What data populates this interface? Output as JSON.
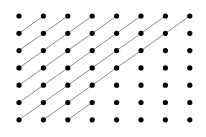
{
  "figure": {
    "name": "dot-lattice-with-diagonal-paths",
    "width": 206,
    "height": 137,
    "background_color": "#ffffff"
  },
  "lattice": {
    "columns": 8,
    "rows": 7,
    "origin_x": 19,
    "origin_y": 16,
    "step_x": 24.4,
    "step_y": 17.3,
    "dot_radius": 2.6,
    "dot_color": "#000000",
    "total_dots": 56
  },
  "edges": {
    "color": "#8c8c8c",
    "width": 1,
    "direction": "lower-left to upper-right",
    "description": "Unit diagonal segments connecting each dot to its up-right neighbor",
    "count": 28,
    "list": [
      {
        "from_col": 0,
        "from_row": 1,
        "to_col": 1,
        "to_row": 0
      },
      {
        "from_col": 0,
        "from_row": 2,
        "to_col": 1,
        "to_row": 1
      },
      {
        "from_col": 1,
        "from_row": 1,
        "to_col": 2,
        "to_row": 0
      },
      {
        "from_col": 0,
        "from_row": 3,
        "to_col": 1,
        "to_row": 2
      },
      {
        "from_col": 1,
        "from_row": 2,
        "to_col": 2,
        "to_row": 1
      },
      {
        "from_col": 2,
        "from_row": 1,
        "to_col": 3,
        "to_row": 0
      },
      {
        "from_col": 0,
        "from_row": 4,
        "to_col": 1,
        "to_row": 3
      },
      {
        "from_col": 1,
        "from_row": 3,
        "to_col": 2,
        "to_row": 2
      },
      {
        "from_col": 2,
        "from_row": 2,
        "to_col": 3,
        "to_row": 1
      },
      {
        "from_col": 3,
        "from_row": 1,
        "to_col": 4,
        "to_row": 0
      },
      {
        "from_col": 0,
        "from_row": 5,
        "to_col": 1,
        "to_row": 4
      },
      {
        "from_col": 1,
        "from_row": 4,
        "to_col": 2,
        "to_row": 3
      },
      {
        "from_col": 2,
        "from_row": 3,
        "to_col": 3,
        "to_row": 2
      },
      {
        "from_col": 3,
        "from_row": 2,
        "to_col": 4,
        "to_row": 1
      },
      {
        "from_col": 4,
        "from_row": 1,
        "to_col": 5,
        "to_row": 0
      },
      {
        "from_col": 0,
        "from_row": 6,
        "to_col": 1,
        "to_row": 5
      },
      {
        "from_col": 1,
        "from_row": 5,
        "to_col": 2,
        "to_row": 4
      },
      {
        "from_col": 2,
        "from_row": 4,
        "to_col": 3,
        "to_row": 3
      },
      {
        "from_col": 3,
        "from_row": 3,
        "to_col": 4,
        "to_row": 2
      },
      {
        "from_col": 4,
        "from_row": 2,
        "to_col": 5,
        "to_row": 1
      },
      {
        "from_col": 5,
        "from_row": 1,
        "to_col": 6,
        "to_row": 0
      },
      {
        "from_col": 1,
        "from_row": 6,
        "to_col": 2,
        "to_row": 5
      },
      {
        "from_col": 2,
        "from_row": 5,
        "to_col": 3,
        "to_row": 4
      },
      {
        "from_col": 3,
        "from_row": 4,
        "to_col": 4,
        "to_row": 3
      },
      {
        "from_col": 4,
        "from_row": 3,
        "to_col": 5,
        "to_row": 2
      },
      {
        "from_col": 5,
        "from_row": 2,
        "to_col": 6,
        "to_row": 1
      },
      {
        "from_col": 6,
        "from_row": 1,
        "to_col": 7,
        "to_row": 0
      },
      {
        "from_col": 2,
        "from_row": 6,
        "to_col": 3,
        "to_row": 5
      }
    ]
  }
}
